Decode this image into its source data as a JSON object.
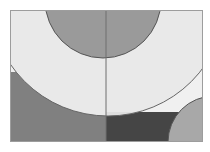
{
  "figure": {
    "width": 210,
    "height": 152,
    "background": "#ffffff",
    "panel": {
      "x": 10,
      "y": 10,
      "width": 193,
      "height": 132,
      "border_color": "#9d9d9d",
      "border_width": 1
    }
  },
  "chart_data": {
    "type": "diagram",
    "title": "",
    "subtitle": "",
    "xlabel": "",
    "ylabel": "",
    "grid": false,
    "legend": null,
    "axis_ranges": {
      "x": [
        10,
        203
      ],
      "y": [
        10,
        142
      ]
    },
    "palette": {
      "panel_light": "#f0f0f0",
      "quadrant_bottom_left": "#808080",
      "quadrant_bottom_right": "#454545",
      "circle_top_fill": "#9a9a9a",
      "circle_big_light_fill": "#e9e9e9",
      "circle_corner_fill": "#a8a8a8",
      "outline": "#555555",
      "divider": "#6e6e6e"
    },
    "regions": [
      {
        "name": "quadrant-top-left",
        "shape": "rect",
        "x": 10,
        "y": 10,
        "width": 96,
        "height": 62,
        "fill": "#f0f0f0"
      },
      {
        "name": "quadrant-top-right",
        "shape": "rect",
        "x": 106,
        "y": 10,
        "width": 97,
        "height": 102,
        "fill": "#f0f0f0"
      },
      {
        "name": "quadrant-bottom-left",
        "shape": "rect",
        "x": 10,
        "y": 72,
        "width": 96,
        "height": 70,
        "fill": "#808080"
      },
      {
        "name": "quadrant-bottom-right",
        "shape": "rect",
        "x": 106,
        "y": 112,
        "width": 97,
        "height": 30,
        "fill": "#454545"
      }
    ],
    "circles": [
      {
        "name": "circle-top-semicircle",
        "cx": 103,
        "cy": 0,
        "r": 58,
        "fill": "#9a9a9a",
        "stroke": "#555555",
        "stroke_width": 1
      },
      {
        "name": "circle-large-light",
        "cx": 108,
        "cy": -2,
        "r": 118,
        "fill": "#e9e9e9",
        "stroke": "#666666",
        "stroke_width": 1
      },
      {
        "name": "circle-bottom-right-corner",
        "cx": 214,
        "cy": 142,
        "r": 46,
        "fill": "#a8a8a8",
        "stroke": "#555555",
        "stroke_width": 1
      }
    ],
    "divider": {
      "name": "vertical-divider",
      "x1": 106,
      "y1": 10,
      "x2": 106,
      "y2": 142,
      "color": "#6e6e6e",
      "width": 1
    }
  }
}
